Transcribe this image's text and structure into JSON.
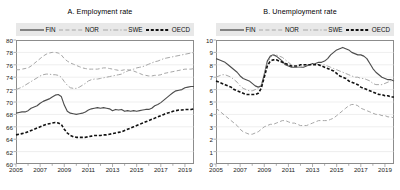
{
  "figure": {
    "width": 400,
    "height": 190,
    "background": "#ffffff",
    "legend_background": "#e8e8e8",
    "frame_color": "#8c8c8c",
    "grid_color": "#dcdcdc"
  },
  "series_styles": {
    "FIN": {
      "color": "#4d4d4d",
      "dash": "none",
      "width": 1.15
    },
    "NOR": {
      "color": "#a6a6a6",
      "dash": "4,2.4",
      "width": 1.0
    },
    "SWE": {
      "color": "#a6a6a6",
      "dash": "5,2,1.3,2",
      "width": 1.0
    },
    "OECD": {
      "color": "#111111",
      "dash": "3,1.8",
      "width": 1.6
    }
  },
  "chart_data": [
    {
      "type": "line",
      "title": "A. Employment rate",
      "xlabel": "",
      "ylabel": "",
      "xlim": [
        2005,
        2019.75
      ],
      "ylim": [
        60,
        80
      ],
      "yticks": [
        60,
        62,
        64,
        66,
        68,
        70,
        72,
        74,
        76,
        78,
        80
      ],
      "xticks": [
        2005,
        2007,
        2009,
        2011,
        2013,
        2015,
        2017,
        2019
      ],
      "xtick_labels": [
        "2005",
        "2007",
        "2009",
        "2011",
        "2013",
        "2015",
        "2017",
        "2019"
      ],
      "grid": true,
      "legend_position": "above-axes",
      "legend_entries": [
        "FIN",
        "NOR",
        "SWE",
        "OECD"
      ],
      "x": [
        2005,
        2005.25,
        2005.5,
        2005.75,
        2006,
        2006.25,
        2006.5,
        2006.75,
        2007,
        2007.25,
        2007.5,
        2007.75,
        2008,
        2008.25,
        2008.5,
        2008.75,
        2009,
        2009.25,
        2009.5,
        2009.75,
        2010,
        2010.25,
        2010.5,
        2010.75,
        2011,
        2011.25,
        2011.5,
        2011.75,
        2012,
        2012.25,
        2012.5,
        2012.75,
        2013,
        2013.25,
        2013.5,
        2013.75,
        2014,
        2014.25,
        2014.5,
        2014.75,
        2015,
        2015.25,
        2015.5,
        2015.75,
        2016,
        2016.25,
        2016.5,
        2016.75,
        2017,
        2017.25,
        2017.5,
        2017.75,
        2018,
        2018.25,
        2018.5,
        2018.75,
        2019,
        2019.25,
        2019.5,
        2019.75
      ],
      "series": [
        {
          "name": "FIN",
          "values": [
            68.2,
            68.3,
            68.4,
            68.4,
            68.6,
            69.0,
            69.2,
            69.4,
            69.8,
            70.1,
            70.3,
            70.5,
            70.8,
            71.1,
            71.2,
            70.9,
            69.5,
            68.5,
            68.2,
            68.1,
            68.0,
            68.1,
            68.2,
            68.4,
            68.7,
            68.9,
            69.0,
            69.1,
            69.0,
            69.1,
            69.0,
            68.9,
            68.6,
            68.8,
            68.7,
            68.8,
            68.5,
            68.6,
            68.5,
            68.6,
            68.5,
            68.6,
            68.7,
            68.8,
            68.8,
            69.0,
            69.4,
            69.6,
            69.9,
            70.3,
            70.7,
            71.1,
            71.5,
            71.8,
            71.9,
            72.0,
            72.3,
            72.4,
            72.5,
            72.5
          ]
        },
        {
          "name": "NOR",
          "values": [
            75.2,
            75.2,
            75.3,
            75.4,
            75.5,
            75.8,
            76.2,
            76.6,
            77.0,
            77.4,
            77.7,
            77.9,
            78.0,
            78.0,
            77.9,
            77.6,
            77.0,
            76.6,
            76.3,
            76.1,
            75.9,
            75.7,
            75.5,
            75.4,
            75.3,
            75.3,
            75.3,
            75.3,
            75.4,
            75.5,
            75.5,
            75.4,
            75.3,
            75.2,
            75.1,
            75.1,
            75.2,
            75.2,
            75.1,
            75.0,
            74.8,
            74.6,
            74.4,
            74.3,
            74.2,
            74.2,
            74.3,
            74.3,
            74.4,
            74.6,
            74.7,
            74.8,
            74.9,
            75.0,
            75.1,
            75.2,
            75.3,
            75.3,
            75.3,
            75.4
          ]
        },
        {
          "name": "SWE",
          "values": [
            72.0,
            72.2,
            72.4,
            72.7,
            73.0,
            73.3,
            73.6,
            73.9,
            74.2,
            74.4,
            74.5,
            74.5,
            74.4,
            74.4,
            74.3,
            74.0,
            73.3,
            72.7,
            72.3,
            72.2,
            72.2,
            72.4,
            72.7,
            73.0,
            73.4,
            73.6,
            73.7,
            73.7,
            73.8,
            73.9,
            74.0,
            74.1,
            74.2,
            74.3,
            74.4,
            74.5,
            74.8,
            75.0,
            75.2,
            75.3,
            75.5,
            75.6,
            75.7,
            75.9,
            76.1,
            76.3,
            76.5,
            76.6,
            76.8,
            77.0,
            77.1,
            77.2,
            77.3,
            77.4,
            77.5,
            77.6,
            77.7,
            77.8,
            77.9,
            78.0
          ]
        },
        {
          "name": "OECD",
          "values": [
            64.7,
            64.8,
            64.9,
            65.0,
            65.2,
            65.4,
            65.6,
            65.8,
            66.0,
            66.2,
            66.4,
            66.5,
            66.6,
            66.7,
            66.6,
            66.4,
            65.6,
            65.0,
            64.6,
            64.4,
            64.3,
            64.3,
            64.3,
            64.3,
            64.4,
            64.5,
            64.6,
            64.6,
            64.6,
            64.7,
            64.7,
            64.8,
            64.9,
            65.0,
            65.1,
            65.2,
            65.4,
            65.6,
            65.8,
            66.0,
            66.2,
            66.4,
            66.6,
            66.8,
            67.0,
            67.2,
            67.4,
            67.6,
            67.8,
            68.0,
            68.2,
            68.3,
            68.5,
            68.6,
            68.7,
            68.7,
            68.8,
            68.8,
            68.8,
            68.9
          ]
        }
      ]
    },
    {
      "type": "line",
      "title": "B. Unemployment rate",
      "xlabel": "",
      "ylabel": "",
      "xlim": [
        2005,
        2019.75
      ],
      "ylim": [
        0,
        10
      ],
      "yticks": [
        0,
        1,
        2,
        3,
        4,
        5,
        6,
        7,
        8,
        9,
        10
      ],
      "xticks": [
        2005,
        2007,
        2009,
        2011,
        2013,
        2015,
        2017,
        2019
      ],
      "xtick_labels": [
        "2005",
        "2007",
        "2009",
        "2011",
        "2013",
        "2015",
        "2017",
        "2019"
      ],
      "grid": true,
      "legend_position": "above-axes",
      "legend_entries": [
        "FIN",
        "NOR",
        "SWE",
        "OECD"
      ],
      "x": [
        2005,
        2005.25,
        2005.5,
        2005.75,
        2006,
        2006.25,
        2006.5,
        2006.75,
        2007,
        2007.25,
        2007.5,
        2007.75,
        2008,
        2008.25,
        2008.5,
        2008.75,
        2009,
        2009.25,
        2009.5,
        2009.75,
        2010,
        2010.25,
        2010.5,
        2010.75,
        2011,
        2011.25,
        2011.5,
        2011.75,
        2012,
        2012.25,
        2012.5,
        2012.75,
        2013,
        2013.25,
        2013.5,
        2013.75,
        2014,
        2014.25,
        2014.5,
        2014.75,
        2015,
        2015.25,
        2015.5,
        2015.75,
        2016,
        2016.25,
        2016.5,
        2016.75,
        2017,
        2017.25,
        2017.5,
        2017.75,
        2018,
        2018.25,
        2018.5,
        2018.75,
        2019,
        2019.25,
        2019.5,
        2019.75
      ],
      "series": [
        {
          "name": "FIN",
          "values": [
            8.5,
            8.4,
            8.3,
            8.2,
            8.0,
            7.8,
            7.6,
            7.4,
            7.1,
            6.9,
            6.8,
            6.7,
            6.5,
            6.3,
            6.2,
            6.3,
            7.2,
            8.3,
            8.7,
            8.8,
            8.7,
            8.5,
            8.3,
            8.0,
            7.9,
            7.8,
            7.8,
            7.8,
            7.8,
            7.8,
            7.9,
            8.0,
            8.1,
            8.1,
            8.2,
            8.2,
            8.3,
            8.5,
            8.8,
            9.0,
            9.2,
            9.3,
            9.4,
            9.3,
            9.2,
            9.0,
            8.9,
            8.8,
            8.8,
            8.7,
            8.5,
            8.1,
            7.7,
            7.4,
            7.2,
            7.0,
            6.9,
            6.8,
            6.8,
            6.7
          ]
        },
        {
          "name": "NOR",
          "values": [
            4.5,
            4.3,
            4.1,
            3.9,
            3.7,
            3.5,
            3.3,
            3.1,
            2.8,
            2.6,
            2.5,
            2.4,
            2.4,
            2.5,
            2.6,
            2.8,
            3.0,
            3.1,
            3.2,
            3.2,
            3.3,
            3.4,
            3.5,
            3.5,
            3.4,
            3.3,
            3.3,
            3.2,
            3.1,
            3.1,
            3.1,
            3.2,
            3.3,
            3.4,
            3.5,
            3.5,
            3.5,
            3.5,
            3.6,
            3.7,
            3.9,
            4.1,
            4.3,
            4.5,
            4.7,
            4.8,
            4.8,
            4.7,
            4.5,
            4.4,
            4.3,
            4.2,
            4.1,
            4.0,
            4.0,
            3.9,
            3.9,
            3.8,
            3.8,
            3.7
          ]
        },
        {
          "name": "SWE",
          "values": [
            7.0,
            7.1,
            7.2,
            7.2,
            7.1,
            7.0,
            6.8,
            6.6,
            6.3,
            6.1,
            6.0,
            5.9,
            5.9,
            6.0,
            6.1,
            6.4,
            7.3,
            8.1,
            8.6,
            8.8,
            8.8,
            8.7,
            8.6,
            8.4,
            8.2,
            8.0,
            7.9,
            7.8,
            7.8,
            7.9,
            8.0,
            8.0,
            8.1,
            8.1,
            8.0,
            8.0,
            8.0,
            7.9,
            7.8,
            7.7,
            7.6,
            7.5,
            7.4,
            7.3,
            7.2,
            7.1,
            7.0,
            7.0,
            6.9,
            6.9,
            6.8,
            6.7,
            6.5,
            6.4,
            6.4,
            6.4,
            6.5,
            6.6,
            6.7,
            6.8
          ]
        },
        {
          "name": "OECD",
          "values": [
            6.7,
            6.6,
            6.5,
            6.4,
            6.3,
            6.2,
            6.0,
            5.9,
            5.8,
            5.7,
            5.6,
            5.6,
            5.6,
            5.6,
            5.7,
            6.1,
            7.0,
            7.9,
            8.3,
            8.4,
            8.4,
            8.3,
            8.2,
            8.1,
            8.0,
            7.9,
            7.9,
            7.9,
            8.0,
            8.0,
            8.0,
            8.0,
            8.0,
            8.0,
            8.0,
            7.9,
            7.8,
            7.7,
            7.6,
            7.5,
            7.3,
            7.1,
            7.0,
            6.9,
            6.7,
            6.6,
            6.5,
            6.4,
            6.2,
            6.1,
            6.0,
            5.9,
            5.8,
            5.7,
            5.6,
            5.6,
            5.5,
            5.5,
            5.4,
            5.4
          ]
        }
      ]
    }
  ]
}
